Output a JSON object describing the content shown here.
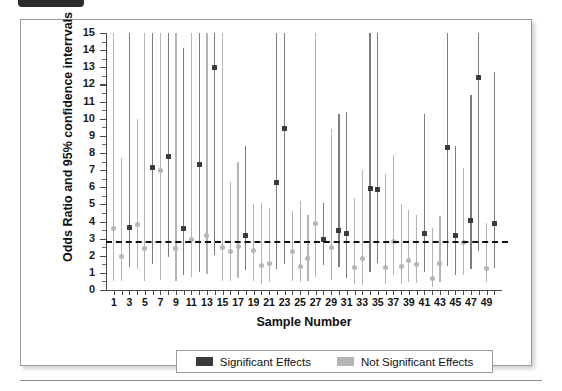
{
  "figure": {
    "y_axis_title": "Odds Ratio and 95% confidence interrvals",
    "x_axis_title": "Sample Number"
  },
  "legend": {
    "position": "bottom-center",
    "items": [
      {
        "label": "Significant Effects",
        "color": "#3a3a3a",
        "marker": "filled-square"
      },
      {
        "label": "Not Significant Effects",
        "color": "#b5b5b5",
        "marker": "filled-square"
      }
    ]
  },
  "colors": {
    "significant": "#3a3a3a",
    "not_significant": "#b5b5b5",
    "ci_significant": "#7d7d7d",
    "ci_not_significant": "#b5b5b5",
    "reference_line": "#111111",
    "axis": "#4a4a4a",
    "background": "#ffffff",
    "frame_border": "#9a9a9a"
  },
  "chart_data": {
    "type": "scatter",
    "title": "",
    "subtitle": "",
    "xlabel": "Sample Number",
    "ylabel": "Odds Ratio and 95% confidence interrvals",
    "xlim": [
      0,
      51
    ],
    "ylim": [
      0,
      15
    ],
    "y_ticks": [
      0,
      1,
      2,
      3,
      4,
      5,
      6,
      7,
      8,
      9,
      10,
      11,
      12,
      13,
      14,
      15
    ],
    "y_tick_labels": [
      "0",
      "1",
      "2",
      "3",
      "4",
      "5",
      "6",
      "7",
      "8",
      "9",
      "10",
      "11",
      "12",
      "13",
      "14",
      "15"
    ],
    "x_ticks": [
      1,
      2,
      3,
      4,
      5,
      6,
      7,
      8,
      9,
      10,
      11,
      12,
      13,
      14,
      15,
      16,
      17,
      18,
      19,
      20,
      21,
      22,
      23,
      24,
      25,
      26,
      27,
      28,
      29,
      30,
      31,
      32,
      33,
      34,
      35,
      36,
      37,
      38,
      39,
      40,
      41,
      42,
      43,
      44,
      45,
      46,
      47,
      48,
      49,
      50
    ],
    "x_tick_labels_shown": [
      "1",
      "3",
      "5",
      "7",
      "9",
      "11",
      "13",
      "15",
      "17",
      "19",
      "21",
      "23",
      "25",
      "27",
      "29",
      "31",
      "33",
      "35",
      "37",
      "39",
      "41",
      "43",
      "45",
      "47",
      "49"
    ],
    "grid": false,
    "legend_position": "bottom",
    "reference_line": {
      "y": 2.85,
      "style": "dashed",
      "label": ""
    },
    "series": [
      {
        "name": "Significant Effects",
        "marker": "filled-square",
        "color": "#3a3a3a",
        "points": [
          {
            "x": 3,
            "estimate": 3.65,
            "ci_low": 1.35,
            "ci_high": 15.0
          },
          {
            "x": 6,
            "estimate": 7.15,
            "ci_low": 1.5,
            "ci_high": 15.0
          },
          {
            "x": 8,
            "estimate": 7.8,
            "ci_low": 1.95,
            "ci_high": 15.0
          },
          {
            "x": 10,
            "estimate": 3.6,
            "ci_low": 0.85,
            "ci_high": 14.1
          },
          {
            "x": 12,
            "estimate": 7.3,
            "ci_low": 1.05,
            "ci_high": 15.0
          },
          {
            "x": 14,
            "estimate": 13.0,
            "ci_low": 2.05,
            "ci_high": 15.0
          },
          {
            "x": 18,
            "estimate": 3.2,
            "ci_low": 1.15,
            "ci_high": 8.4
          },
          {
            "x": 22,
            "estimate": 6.3,
            "ci_low": 1.25,
            "ci_high": 15.0
          },
          {
            "x": 23,
            "estimate": 9.4,
            "ci_low": 1.5,
            "ci_high": 15.0
          },
          {
            "x": 28,
            "estimate": 2.95,
            "ci_low": 1.45,
            "ci_high": 5.1
          },
          {
            "x": 30,
            "estimate": 3.45,
            "ci_low": 1.35,
            "ci_high": 10.3
          },
          {
            "x": 31,
            "estimate": 3.3,
            "ci_low": 0.7,
            "ci_high": 10.4
          },
          {
            "x": 34,
            "estimate": 5.95,
            "ci_low": 1.05,
            "ci_high": 15.0
          },
          {
            "x": 35,
            "estimate": 5.85,
            "ci_low": 1.55,
            "ci_high": 15.0
          },
          {
            "x": 41,
            "estimate": 3.3,
            "ci_low": 1.05,
            "ci_high": 10.3
          },
          {
            "x": 44,
            "estimate": 8.3,
            "ci_low": 1.4,
            "ci_high": 15.0
          },
          {
            "x": 45,
            "estimate": 3.2,
            "ci_low": 0.85,
            "ci_high": 8.4
          },
          {
            "x": 47,
            "estimate": 4.05,
            "ci_low": 1.2,
            "ci_high": 11.4
          },
          {
            "x": 48,
            "estimate": 12.4,
            "ci_low": 2.3,
            "ci_high": 15.0
          },
          {
            "x": 50,
            "estimate": 3.9,
            "ci_low": 1.3,
            "ci_high": 12.7
          }
        ]
      },
      {
        "name": "Not Significant Effects",
        "marker": "filled-circle",
        "color": "#b5b5b5",
        "points": [
          {
            "x": 1,
            "estimate": 3.6,
            "ci_low": 0.55,
            "ci_high": 15.0
          },
          {
            "x": 2,
            "estimate": 1.95,
            "ci_low": 0.5,
            "ci_high": 7.7
          },
          {
            "x": 4,
            "estimate": 3.85,
            "ci_low": 1.25,
            "ci_high": 10.0
          },
          {
            "x": 5,
            "estimate": 2.4,
            "ci_low": 0.55,
            "ci_high": 15.0
          },
          {
            "x": 7,
            "estimate": 6.95,
            "ci_low": 0.6,
            "ci_high": 15.0
          },
          {
            "x": 9,
            "estimate": 2.4,
            "ci_low": 0.5,
            "ci_high": 15.0
          },
          {
            "x": 11,
            "estimate": 2.95,
            "ci_low": 0.75,
            "ci_high": 15.0
          },
          {
            "x": 13,
            "estimate": 3.2,
            "ci_low": 0.95,
            "ci_high": 15.0
          },
          {
            "x": 15,
            "estimate": 2.5,
            "ci_low": 0.55,
            "ci_high": 15.0
          },
          {
            "x": 16,
            "estimate": 2.25,
            "ci_low": 0.5,
            "ci_high": 6.3
          },
          {
            "x": 17,
            "estimate": 2.55,
            "ci_low": 0.7,
            "ci_high": 7.5
          },
          {
            "x": 19,
            "estimate": 2.3,
            "ci_low": 0.5,
            "ci_high": 5.0
          },
          {
            "x": 20,
            "estimate": 1.45,
            "ci_low": 0.35,
            "ci_high": 5.1
          },
          {
            "x": 21,
            "estimate": 1.55,
            "ci_low": 0.45,
            "ci_high": 4.8
          },
          {
            "x": 24,
            "estimate": 2.25,
            "ci_low": 0.55,
            "ci_high": 4.6
          },
          {
            "x": 25,
            "estimate": 1.35,
            "ci_low": 0.45,
            "ci_high": 5.2
          },
          {
            "x": 26,
            "estimate": 1.85,
            "ci_low": 0.5,
            "ci_high": 4.4
          },
          {
            "x": 27,
            "estimate": 3.9,
            "ci_low": 0.75,
            "ci_high": 15.0
          },
          {
            "x": 29,
            "estimate": 2.5,
            "ci_low": 0.6,
            "ci_high": 9.4
          },
          {
            "x": 32,
            "estimate": 1.3,
            "ci_low": 0.35,
            "ci_high": 5.4
          },
          {
            "x": 33,
            "estimate": 1.85,
            "ci_low": 0.3,
            "ci_high": 7.0
          },
          {
            "x": 36,
            "estimate": 1.3,
            "ci_low": 0.35,
            "ci_high": 6.8
          },
          {
            "x": 37,
            "estimate": 2.85,
            "ci_low": 0.85,
            "ci_high": 7.9
          },
          {
            "x": 38,
            "estimate": 1.4,
            "ci_low": 0.35,
            "ci_high": 5.0
          },
          {
            "x": 39,
            "estimate": 1.75,
            "ci_low": 0.5,
            "ci_high": 4.7
          },
          {
            "x": 40,
            "estimate": 1.5,
            "ci_low": 0.4,
            "ci_high": 4.4
          },
          {
            "x": 42,
            "estimate": 0.7,
            "ci_low": 0.2,
            "ci_high": 3.6
          },
          {
            "x": 43,
            "estimate": 1.55,
            "ci_low": 0.45,
            "ci_high": 4.3
          },
          {
            "x": 46,
            "estimate": 2.75,
            "ci_low": 0.85,
            "ci_high": 7.1
          },
          {
            "x": 49,
            "estimate": 1.25,
            "ci_low": 0.45,
            "ci_high": 3.9
          }
        ]
      }
    ]
  }
}
